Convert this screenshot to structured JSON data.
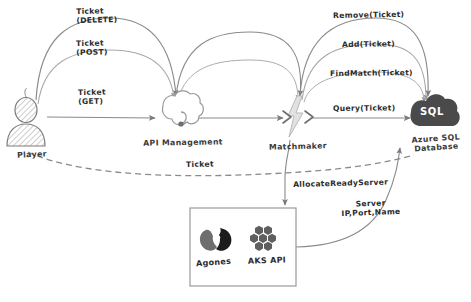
{
  "diagram": {
    "background_color": "#ffffff",
    "ink_color": "#6e6e6e",
    "text_color": "#2b2b2b",
    "sql_fill": "#4a4a4a"
  },
  "nodes": [
    {
      "id": "player",
      "label": "Player",
      "icon": "person-icon"
    },
    {
      "id": "api-management",
      "label": "API Management",
      "icon": "cloud-icon"
    },
    {
      "id": "matchmaker",
      "label": "Matchmaker",
      "icon": "lightning-bolt-icon"
    },
    {
      "id": "azure-sql",
      "label_line1": "Azure SQL",
      "label_line2": "Database",
      "badge": "SQL",
      "icon": "sql-cloud-icon"
    }
  ],
  "cluster_box": {
    "items": [
      {
        "id": "agones",
        "label": "Agones",
        "icon": "agones-logo-icon"
      },
      {
        "id": "aks-api",
        "label": "AKS API",
        "icon": "kubernetes-hexagons-icon"
      }
    ]
  },
  "edges": [
    {
      "id": "ticket-delete",
      "line1": "Ticket",
      "line2": "(DELETE)",
      "from": "player",
      "to": "api-management"
    },
    {
      "id": "ticket-post",
      "line1": "Ticket",
      "line2": "(POST)",
      "from": "player",
      "to": "api-management"
    },
    {
      "id": "ticket-get",
      "line1": "Ticket",
      "line2": "(GET)",
      "from": "player",
      "to": "api-management"
    },
    {
      "id": "remove-ticket",
      "line1": "Remove(Ticket)",
      "from": "matchmaker",
      "to": "azure-sql"
    },
    {
      "id": "add-ticket",
      "line1": "Add(Ticket)",
      "from": "matchmaker",
      "to": "azure-sql"
    },
    {
      "id": "find-match-ticket",
      "line1": "FindMatch(Ticket)",
      "from": "matchmaker",
      "to": "azure-sql"
    },
    {
      "id": "query-ticket",
      "line1": "Query(Ticket)",
      "from": "matchmaker",
      "to": "azure-sql"
    },
    {
      "id": "ticket-dashed",
      "line1": "Ticket",
      "from": "player",
      "to": "azure-sql"
    },
    {
      "id": "allocate-ready-server",
      "line1": "AllocateReadyServer",
      "from": "matchmaker",
      "to": "aks-api"
    },
    {
      "id": "server-details",
      "line1": "Server",
      "line2": "IP,Port,Name",
      "from": "aks-api",
      "to": "azure-sql"
    }
  ]
}
